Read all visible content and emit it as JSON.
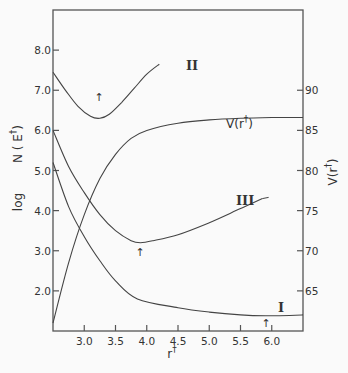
{
  "chart_data": {
    "type": "line",
    "title": "",
    "xlabel": "r†",
    "ylabel": "log N(E†)",
    "ylabel_right": "V(r†)",
    "xlim": [
      2.5,
      6.5
    ],
    "ylim": [
      1.0,
      9.0
    ],
    "ylim_right": [
      60,
      100
    ],
    "grid": false,
    "x_ticks": [
      "3.0",
      "3.5",
      "4.0",
      "4.5",
      "5.0",
      "5.5",
      "6.0"
    ],
    "x_tick_values": [
      3.0,
      3.5,
      4.0,
      4.5,
      5.0,
      5.5,
      6.0
    ],
    "y_ticks": [
      "2.0",
      "3.0",
      "4.0",
      "5.0",
      "6.0",
      "7.0",
      "8.0"
    ],
    "y_tick_values": [
      2.0,
      3.0,
      4.0,
      5.0,
      6.0,
      7.0,
      8.0
    ],
    "y_ticks_right": [
      "65",
      "70",
      "75",
      "80",
      "85",
      "90"
    ],
    "y_tick_values_right": [
      65,
      70,
      75,
      80,
      85,
      90
    ],
    "series": [
      {
        "name": "II",
        "axis": "left",
        "x": [
          2.5,
          2.7,
          2.9,
          3.1,
          3.25,
          3.4,
          3.6,
          3.8,
          4.0,
          4.2
        ],
        "values": [
          7.45,
          7.0,
          6.6,
          6.35,
          6.3,
          6.4,
          6.7,
          7.05,
          7.4,
          7.65
        ],
        "minimum_marker_x": 3.25
      },
      {
        "name": "III",
        "axis": "left",
        "x": [
          2.5,
          2.75,
          3.0,
          3.25,
          3.5,
          3.75,
          3.9,
          4.1,
          4.5,
          5.0,
          5.5,
          5.85
        ],
        "values": [
          6.0,
          5.1,
          4.45,
          3.9,
          3.5,
          3.25,
          3.2,
          3.25,
          3.4,
          3.7,
          4.05,
          4.3
        ],
        "minimum_marker_x": 3.9
      },
      {
        "name": "I",
        "axis": "left",
        "x": [
          2.5,
          2.75,
          3.0,
          3.25,
          3.5,
          3.85,
          4.5,
          5.0,
          5.5,
          5.9,
          6.5
        ],
        "values": [
          5.2,
          4.1,
          3.35,
          2.75,
          2.25,
          1.8,
          1.58,
          1.47,
          1.4,
          1.38,
          1.4
        ],
        "minimum_marker_x": 5.9
      },
      {
        "name": "V(r†)",
        "axis": "right",
        "x": [
          2.5,
          2.75,
          3.0,
          3.25,
          3.5,
          3.75,
          4.0,
          4.5,
          5.0,
          5.5,
          6.0,
          6.5
        ],
        "values": [
          61.0,
          68.5,
          74.5,
          79.0,
          82.0,
          84.0,
          85.0,
          85.9,
          86.3,
          86.5,
          86.6,
          86.6
        ]
      }
    ],
    "annotations": [
      {
        "text": "II",
        "x": 4.25,
        "y": 7.7
      },
      {
        "text": "III",
        "x": 5.95,
        "y": 4.3
      },
      {
        "text": "I",
        "x": 5.95,
        "y": 1.65
      },
      {
        "text": "V(r†)",
        "x": 5.1,
        "y": 6.2
      },
      {
        "text": "↑",
        "x": 3.25,
        "y": 6.1,
        "meaning": "minimum of curve II"
      },
      {
        "text": "↑",
        "x": 3.9,
        "y": 2.95,
        "meaning": "minimum of curve III"
      },
      {
        "text": "↑",
        "x": 5.9,
        "y": 1.15,
        "meaning": "minimum of curve I"
      }
    ]
  },
  "labels": {
    "y_left_log": "log",
    "y_left_main": "N ( E",
    "y_left_dagger": "†",
    "y_left_close": ")",
    "y_right_main": "V(r",
    "y_right_dagger": "†",
    "y_right_close": ")",
    "x_main": "r",
    "x_dagger": "†",
    "curve_II": "II",
    "curve_III": "III",
    "curve_I": "I",
    "curve_V": "V(r",
    "curve_V_dagger": "†",
    "curve_V_close": ")",
    "arrow": "↑"
  }
}
